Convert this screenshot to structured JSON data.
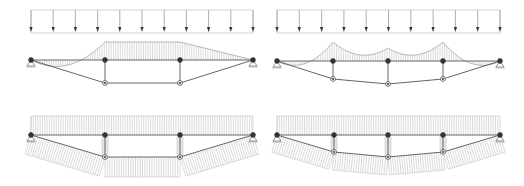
{
  "figure": {
    "colors": {
      "line": "#8a8a8a",
      "member": "#555555",
      "hatch": "#b5b5b5",
      "node": "#333333",
      "background": "#ffffff"
    },
    "panels": [
      {
        "id": "top-left",
        "type": "load-and-moment",
        "structure": "two-strut truss beam (queen-post)",
        "load_arrows": 11,
        "struts": 2
      },
      {
        "id": "top-right",
        "type": "load-and-moment",
        "structure": "three-strut truss beam",
        "load_arrows": 11,
        "struts": 3
      },
      {
        "id": "bottom-left",
        "type": "axial-force",
        "structure": "two-strut truss beam (queen-post)",
        "struts": 2
      },
      {
        "id": "bottom-right",
        "type": "axial-force",
        "structure": "three-strut truss beam",
        "struts": 3
      }
    ]
  }
}
